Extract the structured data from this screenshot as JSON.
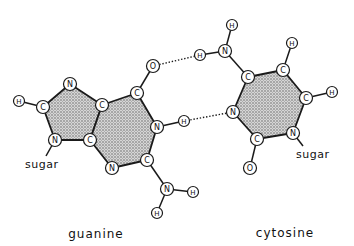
{
  "diagram": {
    "type": "base-pair",
    "labels": {
      "guanine": "guanine",
      "cytosine": "cytosine",
      "sugar_guanine": "sugar",
      "sugar_cytosine": "sugar"
    },
    "colors": {
      "ink": "#1a1a1a",
      "background": "#ffffff",
      "ring_fill": "#bdbdbd"
    },
    "atoms": {
      "G_N7": {
        "el": "N",
        "x": 70,
        "y": 84
      },
      "G_C8": {
        "el": "C",
        "x": 43,
        "y": 107
      },
      "G_H8": {
        "el": "H",
        "x": 19,
        "y": 101
      },
      "G_N9": {
        "el": "N",
        "x": 55,
        "y": 140
      },
      "G_C4": {
        "el": "C",
        "x": 90,
        "y": 140
      },
      "G_C5": {
        "el": "C",
        "x": 102,
        "y": 105
      },
      "G_C6": {
        "el": "C",
        "x": 137,
        "y": 93
      },
      "G_O6": {
        "el": "O",
        "x": 153,
        "y": 66
      },
      "G_N1": {
        "el": "N",
        "x": 157,
        "y": 127
      },
      "G_H1": {
        "el": "H",
        "x": 184,
        "y": 121
      },
      "G_C2": {
        "el": "C",
        "x": 147,
        "y": 160
      },
      "G_N3": {
        "el": "N",
        "x": 112,
        "y": 168
      },
      "G_N2": {
        "el": "N",
        "x": 167,
        "y": 189
      },
      "G_H2a": {
        "el": "H",
        "x": 193,
        "y": 192
      },
      "G_H2b": {
        "el": "H",
        "x": 157,
        "y": 213
      },
      "C_N4": {
        "el": "N",
        "x": 225,
        "y": 51
      },
      "C_H4a": {
        "el": "H",
        "x": 200,
        "y": 55
      },
      "C_H4b": {
        "el": "H",
        "x": 232,
        "y": 25
      },
      "C_C4": {
        "el": "C",
        "x": 248,
        "y": 77
      },
      "C_C5": {
        "el": "C",
        "x": 283,
        "y": 70
      },
      "C_H5": {
        "el": "H",
        "x": 292,
        "y": 43
      },
      "C_C6": {
        "el": "C",
        "x": 306,
        "y": 98
      },
      "C_H6": {
        "el": "H",
        "x": 332,
        "y": 92
      },
      "C_N1": {
        "el": "N",
        "x": 293,
        "y": 133
      },
      "C_C2": {
        "el": "C",
        "x": 257,
        "y": 139
      },
      "C_O2": {
        "el": "O",
        "x": 250,
        "y": 168
      },
      "C_N3": {
        "el": "N",
        "x": 233,
        "y": 112
      }
    },
    "rings": [
      [
        "G_N7",
        "G_C5",
        "G_C4",
        "G_N9",
        "G_C8"
      ],
      [
        "G_C5",
        "G_C6",
        "G_N1",
        "G_C2",
        "G_N3",
        "G_C4"
      ],
      [
        "C_C4",
        "C_C5",
        "C_C6",
        "C_N1",
        "C_C2",
        "C_N3"
      ]
    ],
    "bonds": [
      [
        "G_H8",
        "G_C8"
      ],
      [
        "G_C6",
        "G_O6"
      ],
      [
        "G_N1",
        "G_H1"
      ],
      [
        "G_C2",
        "G_N2"
      ],
      [
        "G_N2",
        "G_H2a"
      ],
      [
        "G_N2",
        "G_H2b"
      ],
      [
        "G_N9",
        "sugar_g"
      ],
      [
        "C_N4",
        "C_H4a"
      ],
      [
        "C_N4",
        "C_H4b"
      ],
      [
        "C_N4",
        "C_C4"
      ],
      [
        "C_C5",
        "C_H5"
      ],
      [
        "C_C6",
        "C_H6"
      ],
      [
        "C_C2",
        "C_O2"
      ],
      [
        "C_N1",
        "sugar_c"
      ]
    ],
    "hydrogen_bonds": [
      [
        "G_O6",
        "C_H4a"
      ],
      [
        "G_H1",
        "C_N3"
      ],
      [
        "G_H2a",
        "C_O2"
      ]
    ],
    "visible_hydrogen_bonds": [
      [
        "G_O6",
        "C_H4a"
      ],
      [
        "G_H1",
        "C_N3"
      ]
    ]
  }
}
